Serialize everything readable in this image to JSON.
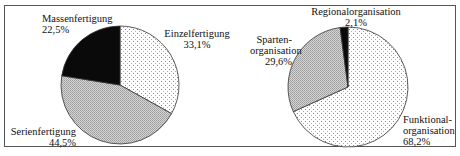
{
  "chart_data": [
    {
      "type": "pie",
      "title": "",
      "categories": [
        "Einzelfertigung",
        "Serienfertigung",
        "Massenfertigung"
      ],
      "values": [
        33.1,
        44.5,
        22.5
      ],
      "value_labels": [
        "33,1%",
        "44,5%",
        "22,5%"
      ],
      "fills": [
        "light-dotted",
        "gray-dense-dotted",
        "black"
      ],
      "start_angle_deg": 0,
      "direction": "clockwise"
    },
    {
      "type": "pie",
      "title": "",
      "categories": [
        "Funktionalorganisation",
        "Spartenorganisation",
        "Regionalorganisation"
      ],
      "values": [
        68.2,
        29.6,
        2.1
      ],
      "value_labels": [
        "68,2%",
        "29,6%",
        "2,1%"
      ],
      "fills": [
        "light-dotted",
        "gray-dense-dotted",
        "black"
      ],
      "start_angle_deg": 0,
      "direction": "clockwise"
    }
  ],
  "left": {
    "mass": {
      "name": "Massenfertigung",
      "pct": "22,5%"
    },
    "einzel": {
      "name": "Einzelfertigung",
      "pct": "33,1%"
    },
    "serien": {
      "name": "Serienfertigung",
      "pct": "44,5%"
    }
  },
  "right": {
    "regional": {
      "name": "Regionalorganisation",
      "pct": "2,1%"
    },
    "sparten": {
      "name1": "Sparten-",
      "name2": "organisation",
      "pct": "29,6%"
    },
    "funktional": {
      "name1": "Funktional-",
      "name2": "organisation",
      "pct": "68,2%"
    }
  }
}
